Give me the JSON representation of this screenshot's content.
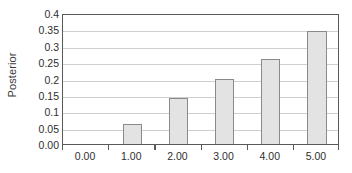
{
  "chart_data": {
    "type": "bar",
    "title": "",
    "subtitle": "",
    "xlabel": "",
    "ylabel": "Posterior",
    "categories": [
      "0.00",
      "1.00",
      "2.00",
      "3.00",
      "4.00",
      "5.00"
    ],
    "values": [
      0.0,
      0.06,
      0.14,
      0.2,
      0.26,
      0.345
    ],
    "ylim": [
      0.0,
      0.4
    ],
    "y_ticks": [
      0.0,
      0.05,
      0.1,
      0.15,
      0.2,
      0.25,
      0.3,
      0.35,
      0.4
    ],
    "y_tick_labels": [
      "0.00",
      "0.05",
      "0.1",
      "0.15",
      "0.2",
      "0.25",
      "0.3",
      "0.35",
      "0.4"
    ],
    "grid": true,
    "legend": false,
    "legend_position": "none",
    "bar_fill_color": "#e3e3e3",
    "bar_border_color": "#8a8a8a",
    "gridline_color": "#cfcfcf",
    "axis_color": "#5a5a5a",
    "background_color": "#ffffff",
    "text_color": "#2e2e2e"
  }
}
